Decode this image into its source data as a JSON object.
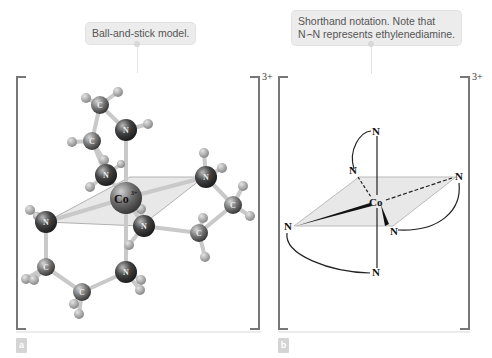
{
  "panel_a": {
    "callout": "Ball-and-stick model.",
    "charge": "3+",
    "tag": "a",
    "metal_label": "Co",
    "metal_charge": "3+",
    "atom_labels": [
      "N",
      "C",
      "H"
    ]
  },
  "panel_b": {
    "callout_line1": "Shorthand notation. Note that",
    "callout_line2": "N⌢N represents ethylenediamine.",
    "charge": "3+",
    "tag": "b",
    "center_label": "Co",
    "ligand_label": "N"
  },
  "colors": {
    "callout_bg": "#ececec",
    "bracket": "#777777",
    "plane_fill": "#e6e6e6",
    "atom_dark": "#3a3a3a",
    "atom_hydrogen": "#9a9a9a"
  }
}
